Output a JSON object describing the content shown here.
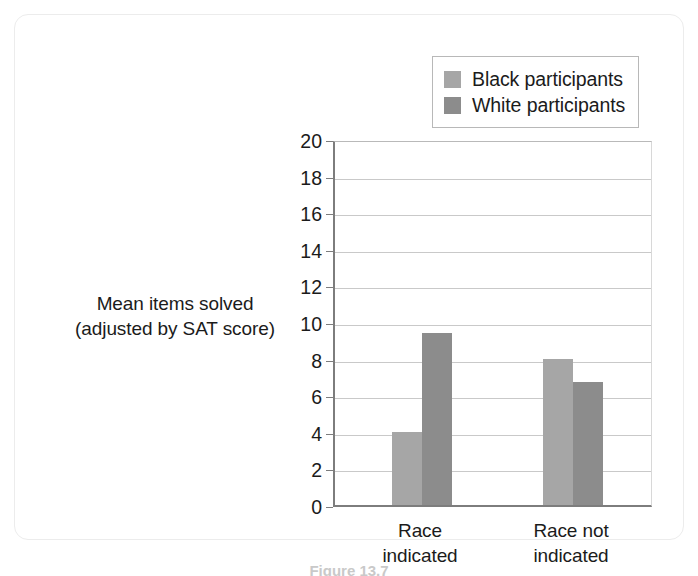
{
  "chart_data": {
    "type": "bar",
    "title": "",
    "xlabel": "",
    "ylabel": "Mean items solved (adjusted by SAT score)",
    "ylabel_lines": [
      "Mean items solved",
      "(adjusted by SAT score)"
    ],
    "categories": [
      "Race indicated",
      "Race not indicated"
    ],
    "category_lines": [
      [
        "Race",
        "indicated"
      ],
      [
        "Race not",
        "indicated"
      ]
    ],
    "series": [
      {
        "name": "Black participants",
        "color": "#a6a6a6",
        "values": [
          4.0,
          8.0
        ]
      },
      {
        "name": "White participants",
        "color": "#8c8c8c",
        "values": [
          9.4,
          6.7
        ]
      }
    ],
    "ylim": [
      0,
      20
    ],
    "ytick_step": 2,
    "yticks": [
      20,
      18,
      16,
      14,
      12,
      10,
      8,
      6,
      4,
      2,
      0
    ],
    "grid": true,
    "legend_position": "top-right"
  },
  "legend": {
    "items": [
      {
        "label": "Black participants",
        "color": "#a6a6a6"
      },
      {
        "label": "White participants",
        "color": "#8c8c8c"
      }
    ]
  },
  "caption": {
    "text": "Figure 13.7"
  },
  "colors": {
    "axis": "#7d7d7d",
    "grid": "#c9c9c9",
    "text": "#1b1b1b",
    "card_border": "#ececec"
  }
}
